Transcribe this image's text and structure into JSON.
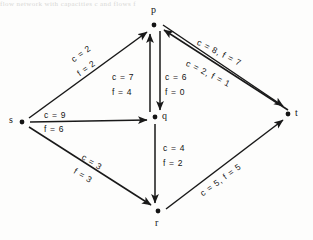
{
  "figure": {
    "ghost_text": "flow network  with  capacities c and flows f",
    "nodes": [
      {
        "id": "s",
        "label": "s",
        "x": 22,
        "y": 122
      },
      {
        "id": "p",
        "label": "p",
        "x": 154,
        "y": 25
      },
      {
        "id": "q",
        "label": "q",
        "x": 155,
        "y": 117
      },
      {
        "id": "r",
        "label": "r",
        "x": 158,
        "y": 211
      },
      {
        "id": "t",
        "label": "t",
        "x": 288,
        "y": 114
      }
    ],
    "edges": [
      {
        "id": "s-p",
        "from": "s",
        "to": "p",
        "capacity": 2,
        "flow": 2,
        "label_c": "c = 2",
        "label_f": "f = 2"
      },
      {
        "id": "s-q",
        "from": "s",
        "to": "q",
        "capacity": 9,
        "flow": 6,
        "label_c": "c = 9",
        "label_f": "f = 6"
      },
      {
        "id": "s-r",
        "from": "s",
        "to": "r",
        "capacity": 3,
        "flow": 3,
        "label_c": "c = 3",
        "label_f": "f = 3"
      },
      {
        "id": "q-p",
        "from": "q",
        "to": "p",
        "capacity": 7,
        "flow": 4,
        "label_c": "c = 7",
        "label_f": "f = 4"
      },
      {
        "id": "p-q",
        "from": "p",
        "to": "q",
        "capacity": 6,
        "flow": 0,
        "label_c": "c = 6",
        "label_f": "f = 0"
      },
      {
        "id": "p-t",
        "from": "p",
        "to": "t",
        "capacity": 8,
        "flow": 7,
        "label_c": "c = 8, f = 7",
        "label_f": ""
      },
      {
        "id": "t-p",
        "from": "t",
        "to": "p",
        "capacity": 2,
        "flow": 1,
        "label_c": "c = 2, f = 1",
        "label_f": ""
      },
      {
        "id": "q-r",
        "from": "q",
        "to": "r",
        "capacity": 4,
        "flow": 2,
        "label_c": "c = 4",
        "label_f": "f = 2"
      },
      {
        "id": "r-t",
        "from": "r",
        "to": "t",
        "capacity": 5,
        "flow": 5,
        "label_c": "c = 5, f = 5",
        "label_f": ""
      }
    ]
  }
}
